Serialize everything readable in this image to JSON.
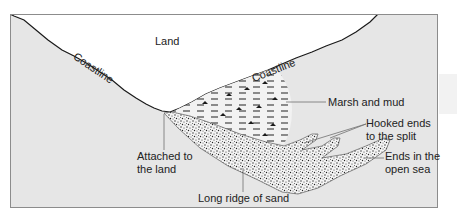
{
  "diagram": {
    "regions": {
      "land": "Land",
      "coastline_left": "Coastline",
      "coastline_right": "Coastline"
    },
    "annotations": {
      "marsh": "Marsh and mud",
      "hooked_line1": "Hooked ends",
      "hooked_line2": "to the split",
      "open_sea_line1": "Ends in the",
      "open_sea_line2": "open sea",
      "attached_line1": "Attached to",
      "attached_line2": "the land",
      "ridge": "Long ridge of sand"
    },
    "colors": {
      "sea": "#e6e6e6",
      "land": "#ffffff",
      "outline": "#1a1a1a",
      "frame": "#8c8c8c",
      "leader": "#707070"
    }
  }
}
